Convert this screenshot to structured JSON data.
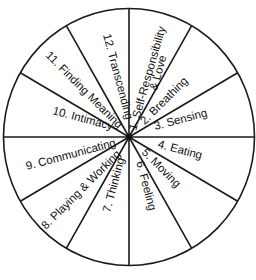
{
  "diagram": {
    "type": "wellness-wheel",
    "center": [
      129,
      137
    ],
    "radius": 126,
    "line_color": "#1a1a1a",
    "text_color": "#111111",
    "sectors": [
      {
        "id": 1,
        "label": "1. Self-Responsibility",
        "label2": "& Love"
      },
      {
        "id": 2,
        "label": "2. Breathing"
      },
      {
        "id": 3,
        "label": "3. Sensing"
      },
      {
        "id": 4,
        "label": "4. Eating"
      },
      {
        "id": 5,
        "label": "5. Moving"
      },
      {
        "id": 6,
        "label": "6. Feeling"
      },
      {
        "id": 7,
        "label": "7. Thinking"
      },
      {
        "id": 8,
        "label": "8. Playing & Working"
      },
      {
        "id": 9,
        "label": "9. Communicating"
      },
      {
        "id": 10,
        "label": "10. Intimacy"
      },
      {
        "id": 11,
        "label": "11. Finding Meaning"
      },
      {
        "id": 12,
        "label": "12. Transcending"
      }
    ]
  }
}
